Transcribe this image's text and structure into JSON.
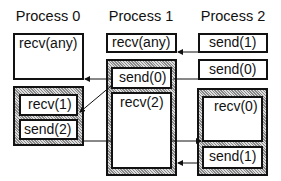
{
  "processes": [
    {
      "label": "Process 0",
      "ops": [
        "recv(any)",
        "recv(1)",
        "send(2)"
      ]
    },
    {
      "label": "Process 1",
      "ops": [
        "recv(any)",
        "send(0)",
        "recv(2)"
      ]
    },
    {
      "label": "Process 2",
      "ops": [
        "send(1)",
        "send(0)",
        "recv(0)",
        "send(1)"
      ]
    }
  ]
}
